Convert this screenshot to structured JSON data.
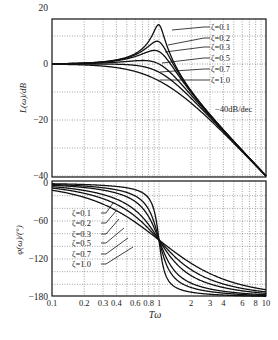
{
  "chart_data": [
    {
      "type": "line",
      "title": "Magnitude response of second-order oscillating element",
      "xlabel": "Tω",
      "ylabel": "L(ω)/dB",
      "xscale": "log",
      "xlim": [
        0.1,
        10
      ],
      "ylim": [
        -40.8,
        20
      ],
      "yticks": [
        20,
        0,
        -20,
        -40
      ],
      "xticks": [
        0.1,
        0.2,
        0.3,
        0.4,
        0.6,
        0.8,
        1,
        2,
        3,
        4,
        6,
        8,
        10
      ],
      "grid": true,
      "annotation": "-40dB/dec",
      "series": [
        {
          "name": "ζ=0.1",
          "zeta": 0.1,
          "x": [
            0.1,
            0.5,
            0.9,
            1,
            1.2,
            2,
            10
          ],
          "values": [
            0.09,
            2.4,
            10.5,
            14.0,
            4.6,
            -9.6,
            -39.9
          ]
        },
        {
          "name": "ζ=0.2",
          "zeta": 0.2,
          "x": [
            0.1,
            0.5,
            0.9,
            1,
            1.2,
            2,
            10
          ],
          "values": [
            0.08,
            2.2,
            6.9,
            8.0,
            3.8,
            -9.7,
            -39.9
          ]
        },
        {
          "name": "ζ=0.3",
          "zeta": 0.3,
          "x": [
            0.1,
            0.5,
            0.9,
            1,
            1.2,
            2,
            10
          ],
          "values": [
            0.07,
            1.8,
            4.5,
            4.4,
            2.6,
            -9.9,
            -39.9
          ]
        },
        {
          "name": "ζ=0.5",
          "zeta": 0.5,
          "x": [
            0.1,
            0.5,
            0.9,
            1,
            1.2,
            2,
            10
          ],
          "values": [
            0.04,
            0.9,
            1.2,
            0.0,
            -0.6,
            -10.7,
            -40.0
          ]
        },
        {
          "name": "ζ=0.7",
          "zeta": 0.7,
          "x": [
            0.1,
            0.5,
            0.9,
            1,
            1.2,
            2,
            10
          ],
          "values": [
            0.0,
            -0.3,
            -2.0,
            -2.9,
            -3.9,
            -11.8,
            -40.0
          ]
        },
        {
          "name": "ζ=1.0",
          "zeta": 1.0,
          "x": [
            0.1,
            0.5,
            0.9,
            1,
            1.2,
            2,
            10
          ],
          "values": [
            -0.1,
            -1.9,
            -5.1,
            -6.0,
            -7.7,
            -14.0,
            -40.1
          ]
        }
      ]
    },
    {
      "type": "line",
      "title": "Phase response of second-order oscillating element",
      "xlabel": "Tω",
      "ylabel": "φ(ω)/(°)",
      "xscale": "log",
      "xlim": [
        0.1,
        10
      ],
      "ylim": [
        -180,
        0
      ],
      "yticks": [
        0,
        -60,
        -120,
        -180
      ],
      "xticks": [
        0.1,
        0.2,
        0.3,
        0.4,
        0.6,
        0.8,
        1,
        2,
        3,
        4,
        6,
        8,
        10
      ],
      "grid": true,
      "series": [
        {
          "name": "ζ=0.1",
          "zeta": 0.1,
          "x": [
            0.1,
            0.5,
            1,
            2,
            10
          ],
          "values": [
            -1.2,
            -7.6,
            -90,
            -172.4,
            -178.8
          ]
        },
        {
          "name": "ζ=0.2",
          "zeta": 0.2,
          "x": [
            0.1,
            0.5,
            1,
            2,
            10
          ],
          "values": [
            -2.3,
            -14.9,
            -90,
            -165.1,
            -177.7
          ]
        },
        {
          "name": "ζ=0.3",
          "zeta": 0.3,
          "x": [
            0.1,
            0.5,
            1,
            2,
            10
          ],
          "values": [
            -3.5,
            -21.8,
            -90,
            -158.2,
            -176.5
          ]
        },
        {
          "name": "ζ=0.5",
          "zeta": 0.5,
          "x": [
            0.1,
            0.5,
            1,
            2,
            10
          ],
          "values": [
            -5.8,
            -33.7,
            -90,
            -146.3,
            -174.2
          ]
        },
        {
          "name": "ζ=0.7",
          "zeta": 0.7,
          "x": [
            0.1,
            0.5,
            1,
            2,
            10
          ],
          "values": [
            -8.1,
            -43.0,
            -90,
            -137.0,
            -171.9
          ]
        },
        {
          "name": "ζ=1.0",
          "zeta": 1.0,
          "x": [
            0.1,
            0.5,
            1,
            2,
            10
          ],
          "values": [
            -11.4,
            -53.1,
            -90,
            -126.9,
            -168.6
          ]
        }
      ]
    }
  ],
  "upper": {
    "ylabel": "L(ω)/dB",
    "yticks": [
      {
        "v": 20,
        "label": "20"
      },
      {
        "v": 0,
        "label": "0"
      },
      {
        "v": -20,
        "label": "−20"
      },
      {
        "v": -40,
        "label": "−40"
      }
    ],
    "annotation": "−40dB/dec",
    "legend": [
      "ζ=0.1",
      "ζ=0.2",
      "ζ=0.3",
      "ζ=0.5",
      "ζ=0.7",
      "ζ=1.0"
    ]
  },
  "lower": {
    "ylabel": "φ(ω)/(°)",
    "yticks": [
      {
        "v": 0,
        "label": "0"
      },
      {
        "v": -60,
        "label": "−60"
      },
      {
        "v": -120,
        "label": "−120"
      },
      {
        "v": -180,
        "label": "−180"
      }
    ],
    "legend": [
      "ζ=0.1",
      "ζ=0.2",
      "ζ=0.3",
      "ζ=0.5",
      "ζ=0.7",
      "ζ=1.0"
    ]
  },
  "xaxis": {
    "label": "Tω",
    "ticks": [
      {
        "v": 0.1,
        "label": "0.1"
      },
      {
        "v": 0.2,
        "label": "0.2"
      },
      {
        "v": 0.3,
        "label": "0.3"
      },
      {
        "v": 0.4,
        "label": "0.4"
      },
      {
        "v": 0.6,
        "label": "0.6"
      },
      {
        "v": 0.8,
        "label": "0.8"
      },
      {
        "v": 1,
        "label": "1"
      },
      {
        "v": 2,
        "label": "2"
      },
      {
        "v": 3,
        "label": "3"
      },
      {
        "v": 4,
        "label": "4"
      },
      {
        "v": 6,
        "label": "6"
      },
      {
        "v": 8,
        "label": "8"
      },
      {
        "v": 10,
        "label": "10"
      }
    ]
  },
  "zetas": [
    0.1,
    0.2,
    0.3,
    0.5,
    0.7,
    1.0
  ]
}
